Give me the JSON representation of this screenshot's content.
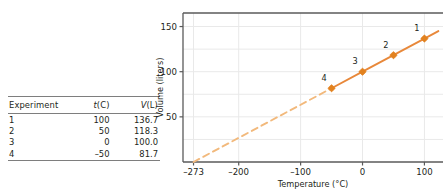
{
  "table": {
    "name": "gas-law-experiment-table",
    "headers": [
      "Experiment",
      "t(C)",
      "V(L)"
    ],
    "header_italic_prefix": [
      "",
      "t",
      "V"
    ],
    "header_rest": [
      "Experiment",
      "(C)",
      "(L)"
    ],
    "rows": [
      {
        "experiment": "1",
        "t": "100",
        "v": "136.7"
      },
      {
        "experiment": "2",
        "t": "50",
        "v": "118.3"
      },
      {
        "experiment": "3",
        "t": "0",
        "v": "100.0"
      },
      {
        "experiment": "4",
        "t": "–50",
        "v": "81.7"
      }
    ]
  },
  "chart_data": {
    "type": "line",
    "title": "",
    "xlabel": "Temperature (°C)",
    "ylabel": "Volume (liters)",
    "xlim": [
      -290,
      130
    ],
    "ylim": [
      0,
      165
    ],
    "xticks": [
      "-273",
      "-200",
      "-100",
      "0",
      "100"
    ],
    "xtick_values": [
      -273,
      -200,
      -100,
      0,
      100
    ],
    "yticks": [
      "50",
      "100",
      "150"
    ],
    "ytick_values": [
      50,
      100,
      150
    ],
    "grid": true,
    "grid_x_values": [
      -273,
      -200,
      -100,
      0,
      100
    ],
    "grid_y_values": [
      25,
      50,
      75,
      100,
      125,
      150
    ],
    "legend": "none",
    "series": [
      {
        "name": "measured",
        "style": "solid",
        "color": "#e8883a",
        "points": [
          {
            "label": "1",
            "x": 100,
            "y": 136.7
          },
          {
            "label": "2",
            "x": 50,
            "y": 118.3
          },
          {
            "label": "3",
            "x": 0,
            "y": 100.0
          },
          {
            "label": "4",
            "x": -50,
            "y": 81.7
          }
        ]
      },
      {
        "name": "extrapolation",
        "style": "dashed",
        "color": "#f2b97c",
        "points": [
          {
            "label": "",
            "x": -273,
            "y": 0
          },
          {
            "label": "",
            "x": -50,
            "y": 81.7
          }
        ]
      }
    ],
    "annotations": [
      {
        "text": "1",
        "x": 100,
        "y": 136.7
      },
      {
        "text": "2",
        "x": 50,
        "y": 118.3
      },
      {
        "text": "3",
        "x": 0,
        "y": 100.0
      },
      {
        "text": "4",
        "x": -50,
        "y": 81.7
      }
    ]
  },
  "colors": {
    "line": "#e8883a",
    "dash": "#f2b97c",
    "marker": "#e2821f",
    "grid": "#e9e9e9",
    "axis": "#5a5a5a",
    "rule": "#7e7e7e",
    "text": "#231f20"
  }
}
